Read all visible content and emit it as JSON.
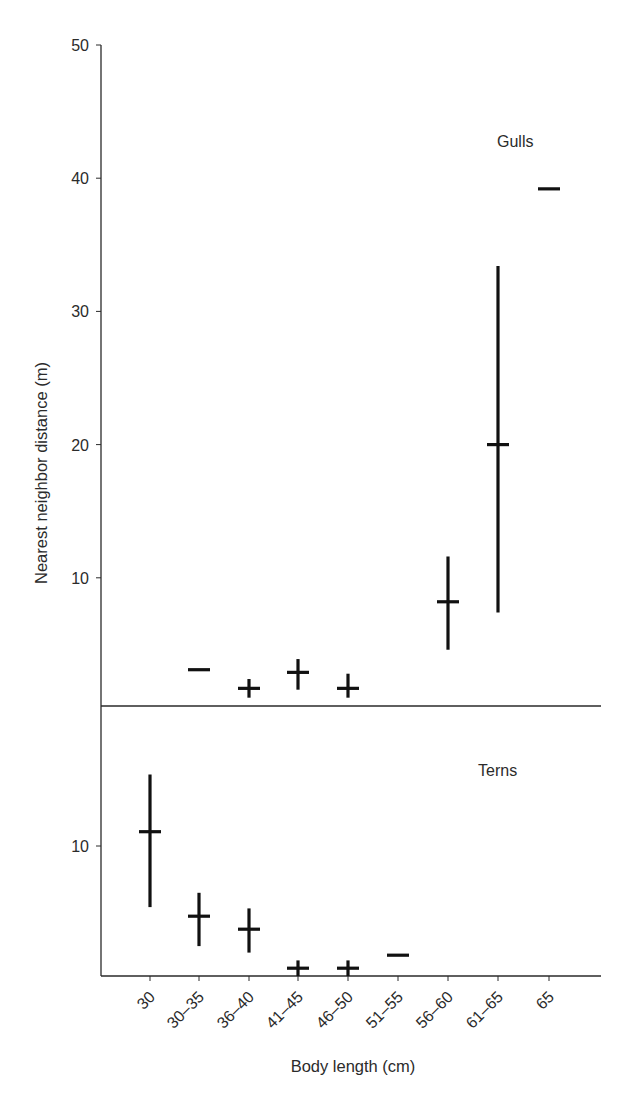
{
  "chart_data": {
    "type": "scatter",
    "subtype": "mean-with-range (error bars), two stacked panels sharing x-axis",
    "xlabel": "Body length (cm)",
    "ylabel": "Nearest neighbor distance (m)",
    "categories": [
      "30",
      "30–35",
      "36–40",
      "41–45",
      "46–50",
      "51–55",
      "56–60",
      "61–65",
      "65"
    ],
    "panels": [
      {
        "name": "Gulls",
        "label": "Gulls",
        "ylim": [
          0,
          50
        ],
        "yticks": [
          10,
          20,
          30,
          40,
          50
        ],
        "series": [
          {
            "category": "30",
            "mean": null,
            "low": null,
            "high": null
          },
          {
            "category": "30–35",
            "mean": 3.1,
            "low": 3.1,
            "high": 3.1
          },
          {
            "category": "36–40",
            "mean": 1.7,
            "low": 1.0,
            "high": 2.4
          },
          {
            "category": "41–45",
            "mean": 2.9,
            "low": 1.6,
            "high": 3.9
          },
          {
            "category": "46–50",
            "mean": 1.7,
            "low": 1.0,
            "high": 2.8
          },
          {
            "category": "51–55",
            "mean": null,
            "low": null,
            "high": null
          },
          {
            "category": "56–60",
            "mean": 8.2,
            "low": 4.6,
            "high": 11.6
          },
          {
            "category": "61–65",
            "mean": 20.0,
            "low": 7.4,
            "high": 33.4
          },
          {
            "category": "65",
            "mean": 39.2,
            "low": 39.2,
            "high": 39.2
          }
        ]
      },
      {
        "name": "Terns",
        "label": "Terns",
        "ylim": [
          0,
          17
        ],
        "yticks": [
          10
        ],
        "series": [
          {
            "category": "30",
            "mean": 11.1,
            "low": 5.3,
            "high": 15.5
          },
          {
            "category": "30–35",
            "mean": 4.6,
            "low": 2.3,
            "high": 6.4
          },
          {
            "category": "36–40",
            "mean": 3.6,
            "low": 1.8,
            "high": 5.2
          },
          {
            "category": "41–45",
            "mean": 0.6,
            "low": 0.0,
            "high": 1.2
          },
          {
            "category": "46–50",
            "mean": 0.6,
            "low": 0.0,
            "high": 1.2
          },
          {
            "category": "51–55",
            "mean": 1.6,
            "low": 1.6,
            "high": 1.6
          },
          {
            "category": "56–60",
            "mean": null,
            "low": null,
            "high": null
          },
          {
            "category": "61–65",
            "mean": null,
            "low": null,
            "high": null
          },
          {
            "category": "65",
            "mean": null,
            "low": null,
            "high": null
          }
        ]
      }
    ],
    "grid": false,
    "legend": null
  },
  "layout": {
    "plot_left": 101,
    "plot_right": 601,
    "x_positions": [
      150,
      199,
      249,
      298,
      348,
      398,
      448,
      498,
      549
    ],
    "gulls": {
      "y_zero": 711,
      "px_per_unit": 13.32,
      "top": 45,
      "divider_y": 706
    },
    "terns": {
      "y_zero": 976,
      "px_per_unit": 13.0,
      "top": 706,
      "bottom_axis_y": 976
    },
    "cap_half_width": 11,
    "colors": {
      "marks": "#111111",
      "axes": "#2a2a2a",
      "text": "#2b2b2b",
      "background": "#ffffff"
    }
  }
}
